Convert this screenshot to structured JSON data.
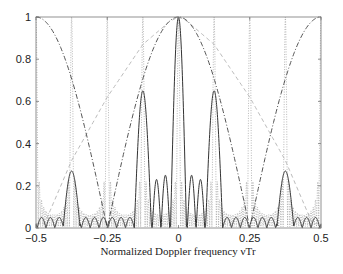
{
  "chart_data": {
    "type": "line",
    "title": "",
    "xlabel": "Normalized Doppler frequency νTr",
    "ylabel": "",
    "xlim": [
      -0.5,
      0.5
    ],
    "ylim": [
      0,
      1
    ],
    "xticks": [
      -0.5,
      -0.25,
      0,
      0.25,
      0.5
    ],
    "xtick_labels": [
      "−0.5",
      "−0.25",
      "0",
      "0.25",
      "0.5"
    ],
    "yticks": [
      0,
      0.2,
      0.4,
      0.6,
      0.8,
      1
    ],
    "ytick_labels": [
      "0",
      "0.2",
      "0.4",
      "0.6",
      "0.8",
      "1"
    ],
    "grid": false,
    "legend": null,
    "series": [
      {
        "name": "composite response (solid)",
        "style": "solid",
        "color": "#333333",
        "peaks": [
          {
            "x": -0.375,
            "y": 0.27
          },
          {
            "x": -0.125,
            "y": 0.65
          },
          {
            "x": -0.077,
            "y": 0.23
          },
          {
            "x": -0.046,
            "y": 0.25
          },
          {
            "x": 0,
            "y": 1.0
          },
          {
            "x": 0.046,
            "y": 0.25
          },
          {
            "x": 0.077,
            "y": 0.23
          },
          {
            "x": 0.125,
            "y": 0.65
          },
          {
            "x": 0.375,
            "y": 0.27
          }
        ],
        "sidelobe_floor": 0.05
      },
      {
        "name": "grating lobes (dotted)",
        "style": "dotted",
        "color": "#9a9a9a",
        "peaks_at_1": [
          -0.5,
          -0.375,
          -0.25,
          -0.125,
          0,
          0.125,
          0.25,
          0.375,
          0.5
        ],
        "period": 0.125
      },
      {
        "name": "|cos(2πνTr)| envelope (dash-dot)",
        "style": "dashdot",
        "color": "#555555",
        "x": [
          -0.5,
          -0.375,
          -0.25,
          -0.125,
          0,
          0.125,
          0.25,
          0.375,
          0.5
        ],
        "y": [
          1,
          0.71,
          0,
          0.71,
          1,
          0.71,
          0,
          0.71,
          1
        ]
      },
      {
        "name": "broad envelope (light dashed)",
        "style": "dashed",
        "color": "#bbbbbb",
        "x": [
          -0.47,
          -0.375,
          -0.25,
          -0.125,
          -0.03,
          0,
          0.03,
          0.125,
          0.25,
          0.375,
          0.47
        ],
        "y": [
          0.02,
          0.32,
          0.62,
          0.87,
          0.98,
          1.0,
          0.98,
          0.87,
          0.62,
          0.32,
          0.02
        ]
      }
    ]
  }
}
